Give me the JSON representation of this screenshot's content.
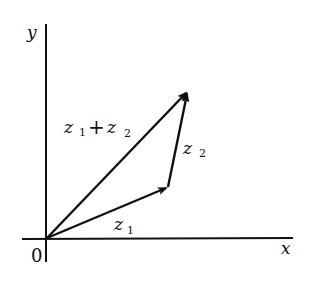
{
  "diagram": {
    "axes": {
      "x_label": "x",
      "y_label": "y",
      "origin_label": "0"
    },
    "vectors": [
      {
        "name": "z1",
        "label_base": "z",
        "label_sub": "1",
        "from": [
          47,
          238
        ],
        "to": [
          168,
          187
        ]
      },
      {
        "name": "z2",
        "label_base": "z",
        "label_sub": "2",
        "from": [
          168,
          187
        ],
        "to": [
          188,
          91
        ]
      },
      {
        "name": "z1+z2",
        "label_base1": "z",
        "label_sub1": "1",
        "plus": "+",
        "label_base2": "z",
        "label_sub2": "2",
        "from": [
          47,
          238
        ],
        "to": [
          188,
          91
        ]
      }
    ],
    "colors": {
      "line": "#111111",
      "background": "#ffffff"
    }
  }
}
